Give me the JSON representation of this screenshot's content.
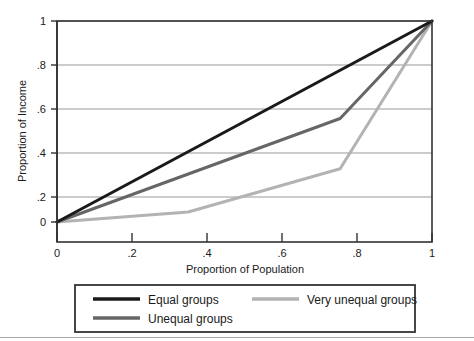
{
  "chart_data": {
    "type": "line",
    "title": "",
    "subtitle": "",
    "xlabel": "Proportion of Population",
    "ylabel": "Proportion of Income",
    "xlim": [
      0,
      1
    ],
    "ylim": [
      0,
      1
    ],
    "xticks": [
      "0",
      ".2",
      ".4",
      ".6",
      ".8",
      "1"
    ],
    "xtick_values": [
      0,
      0.2,
      0.4,
      0.6,
      0.8,
      1
    ],
    "yticks": [
      "0",
      ".2",
      ".4",
      ".6",
      ".8",
      "1"
    ],
    "ytick_values": [
      0,
      0.2,
      0.4,
      0.6,
      0.8,
      1
    ],
    "grid": "horizontal",
    "legend_position": "below-axes",
    "series": [
      {
        "name": "Equal groups",
        "color": "#1a1a1a",
        "width": 3.0,
        "x": [
          0,
          1
        ],
        "y": [
          0,
          1
        ]
      },
      {
        "name": "Unequal groups",
        "color": "#666666",
        "width": 3.0,
        "x": [
          0,
          0.755,
          1
        ],
        "y": [
          0,
          0.515,
          1
        ]
      },
      {
        "name": "Very unequal groups",
        "color": "#b3b3b3",
        "width": 3.0,
        "x": [
          0,
          0.35,
          0.755,
          1
        ],
        "y": [
          0,
          0.05,
          0.265,
          1
        ]
      }
    ]
  },
  "legend": {
    "entries": [
      {
        "label": "Equal groups",
        "color": "#1a1a1a"
      },
      {
        "label": "Unequal groups",
        "color": "#666666"
      },
      {
        "label": "Very unequal groups",
        "color": "#b3b3b3"
      }
    ]
  },
  "colors": {
    "background": "#ffffff",
    "frame": "#333333",
    "gridline": "#999999",
    "text": "#1a1a1a"
  }
}
